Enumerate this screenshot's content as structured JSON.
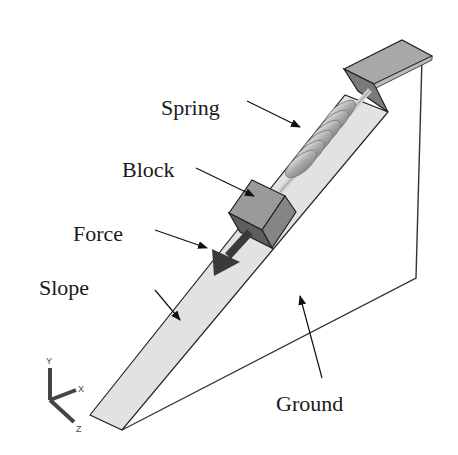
{
  "diagram": {
    "type": "mechanical-model-illustration",
    "labels": {
      "spring": "Spring",
      "block": "Block",
      "force": "Force",
      "slope": "Slope",
      "ground": "Ground"
    },
    "axes": {
      "x": "X",
      "y": "Y",
      "z": "Z"
    },
    "colors": {
      "background": "#ffffff",
      "slope_fill": "#e2e2e2",
      "block_top": "#9a9a9a",
      "block_side": "#7d7d7d",
      "block_front": "#8c8c8c",
      "force_arrow": "#3a3a3a",
      "spring": "#b5b5b5",
      "bracket_top": "#a8a8a8",
      "bracket_side": "#8a8a8a",
      "outline": "#222222"
    }
  }
}
